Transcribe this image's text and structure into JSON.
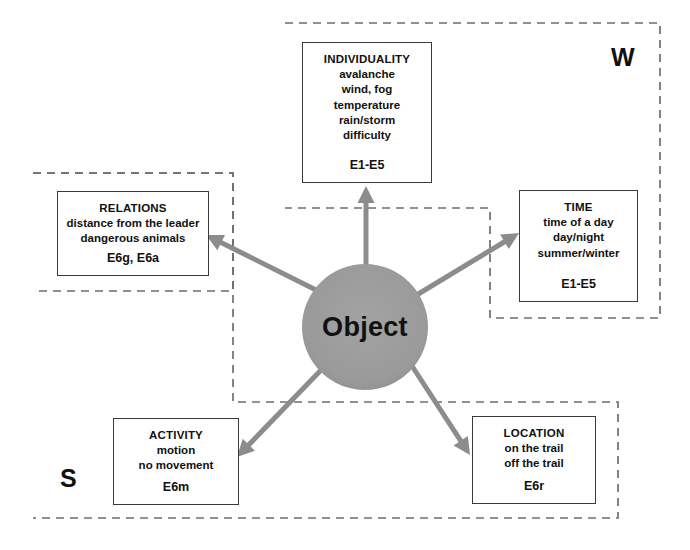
{
  "diagram": {
    "center": {
      "label": "Object",
      "shape": "circle",
      "fill": "#9a9a9a",
      "cx": 365,
      "cy": 327,
      "r": 63
    },
    "regions": [
      {
        "key": "w",
        "label": "W",
        "label_x": 611,
        "label_y": 45,
        "style": "dashed",
        "color": "#6e6e6e",
        "points": "285,23 660,23 660,318 490,318 490,208 285,208"
      },
      {
        "key": "s",
        "label": "S",
        "label_x": 60,
        "label_y": 466,
        "style": "dashed",
        "color": "#6e6e6e",
        "points": "33,173 233,173 233,402 618,402 618,518 33,518"
      },
      {
        "key": "relations-subregion",
        "label": "",
        "style": "dashed",
        "color": "#6e6e6e",
        "points": "33,173 233,173 233,291 33,291"
      }
    ],
    "nodes": [
      {
        "key": "individuality",
        "title": "INDIVIDUALITY",
        "lines": [
          "avalanche",
          "wind, fog",
          "temperature",
          "rain/storm",
          "difficulty"
        ],
        "code": "E1-E5",
        "x": 302,
        "y": 42,
        "w": 130,
        "h": 141
      },
      {
        "key": "relations",
        "title": "RELATIONS",
        "lines": [
          "distance from the leader",
          "dangerous animals"
        ],
        "code": "E6g, E6a",
        "x": 57,
        "y": 191,
        "w": 152,
        "h": 85
      },
      {
        "key": "time",
        "title": "TIME",
        "lines": [
          "time of a day",
          "day/night",
          "summer/winter"
        ],
        "code": "E1-E5",
        "x": 519,
        "y": 190,
        "w": 119,
        "h": 112
      },
      {
        "key": "activity",
        "title": "ACTIVITY",
        "lines": [
          "motion",
          "no movement"
        ],
        "code": "E6m",
        "x": 113,
        "y": 418,
        "w": 126,
        "h": 87
      },
      {
        "key": "location",
        "title": "LOCATION",
        "lines": [
          "on the trail",
          "off the trail"
        ],
        "code": "E6r",
        "x": 472,
        "y": 416,
        "w": 124,
        "h": 88
      }
    ],
    "arrows": [
      {
        "key": "to-individuality",
        "from_x": 366,
        "from_y": 266,
        "to_x": 366,
        "to_y": 186,
        "color": "#8c8c8c"
      },
      {
        "key": "to-relations",
        "from_x": 320,
        "from_y": 292,
        "to_x": 206,
        "to_y": 235,
        "color": "#8c8c8c"
      },
      {
        "key": "to-time",
        "from_x": 415,
        "from_y": 296,
        "to_x": 519,
        "to_y": 233,
        "color": "#8c8c8c"
      },
      {
        "key": "to-activity",
        "from_x": 323,
        "from_y": 368,
        "to_x": 237,
        "to_y": 457,
        "color": "#8c8c8c"
      },
      {
        "key": "to-location",
        "from_x": 412,
        "from_y": 366,
        "to_x": 470,
        "to_y": 455,
        "color": "#8c8c8c"
      }
    ]
  }
}
